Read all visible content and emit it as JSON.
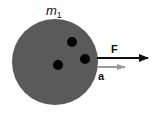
{
  "diagram": {
    "mass_label_base": "m",
    "mass_label_sub": "1",
    "force_label": "F",
    "acceleration_label": "a",
    "colors": {
      "body_fill": "#5a5a5a",
      "dot_fill": "#000000",
      "force_arrow": "#111111",
      "acceleration_arrow": "#9a9a9a",
      "text": "#111111"
    }
  }
}
